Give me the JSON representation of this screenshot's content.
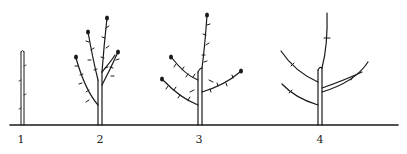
{
  "figure": {
    "stages": [
      {
        "label": "1",
        "x": 21
      },
      {
        "label": "2",
        "x": 100
      },
      {
        "label": "3",
        "x": 199
      },
      {
        "label": "4",
        "x": 320
      }
    ],
    "colors": {
      "ink": "#1a1a1a",
      "background": "#ffffff"
    }
  }
}
